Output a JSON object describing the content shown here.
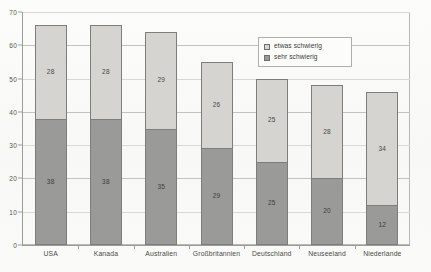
{
  "chart_data": {
    "type": "bar",
    "subtype": "stacked-bar",
    "title": "",
    "xlabel": "",
    "ylabel": "",
    "ylim": [
      0,
      70
    ],
    "ytick_values": [
      0,
      10,
      20,
      30,
      40,
      50,
      60,
      70
    ],
    "ytick_labels": [
      "0",
      "10",
      "20",
      "30",
      "40",
      "50",
      "60",
      "70"
    ],
    "grid": true,
    "grid_axis": "y",
    "legend_position": "upper right inside plot",
    "categories": [
      "USA",
      "Kanada",
      "Australien",
      "Großbritannien",
      "Deutschland",
      "Neuseeland",
      "Niederlande"
    ],
    "series": [
      {
        "name": "sehr schwierig",
        "color": "#9a9a98",
        "stack_order": "bottom",
        "values": [
          38,
          38,
          35,
          29,
          25,
          20,
          12
        ]
      },
      {
        "name": "etwas schwierig",
        "color": "#d5d4d0",
        "stack_order": "top",
        "values": [
          28,
          28,
          29,
          26,
          25,
          28,
          34
        ]
      }
    ],
    "totals": [
      66,
      66,
      64,
      55,
      50,
      48,
      46
    ],
    "data_labels_shown": true
  },
  "legend": {
    "entries": [
      {
        "label": "etwas schwierig",
        "swatch": "light"
      },
      {
        "label": "sehr schwierig",
        "swatch": "dark"
      }
    ]
  },
  "colors": {
    "segment_light": "#d5d4d0",
    "segment_dark": "#9a9a98",
    "segment_border": "#7d7d79",
    "axis": "#9d9d98",
    "gridline": "#d9d9d4",
    "background": "#fbfbf9",
    "text": "#3a3a38"
  }
}
